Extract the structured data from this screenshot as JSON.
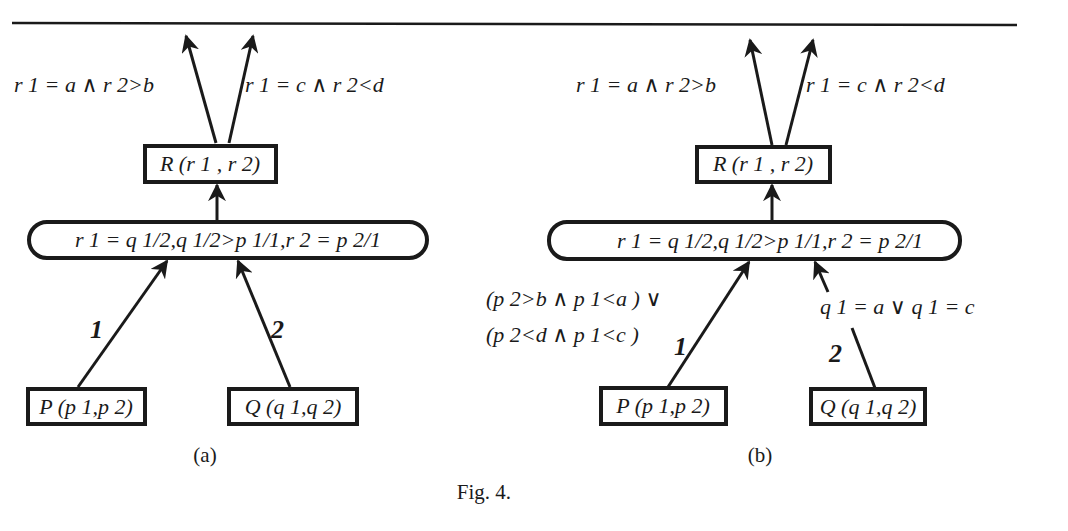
{
  "figure": {
    "caption": "Fig. 4.",
    "panels": [
      {
        "id": "a",
        "label": "(a)",
        "top_edge_labels": {
          "left": "r 1 = a ∧ r 2>b",
          "right": "r 1 = c ∧ r 2<d"
        },
        "result_node": "R (r 1 , r 2)",
        "join_node": "r 1 = q 1/2,q 1/2>p 1/1,r 2 = p 2/1",
        "input_nodes": [
          {
            "name": "P (p 1,p 2)",
            "edge_number": "1"
          },
          {
            "name": "Q (q 1,q 2)",
            "edge_number": "2"
          }
        ]
      },
      {
        "id": "b",
        "label": "(b)",
        "top_edge_labels": {
          "left": "r 1 = a ∧ r 2>b",
          "right": "r 1 = c ∧ r 2<d"
        },
        "result_node": "R (r 1 , r 2)",
        "join_node": "r 1 = q 1/2,q 1/2>p 1/1,r 2 = p 2/1",
        "input_nodes": [
          {
            "name": "P (p 1,p 2)",
            "edge_number": "1",
            "edge_condition": [
              "(p 2>b ∧ p 1<a ) ∨",
              "(p 2<d ∧ p 1<c )"
            ]
          },
          {
            "name": "Q (q 1,q 2)",
            "edge_number": "2",
            "edge_condition": [
              "q 1 = a ∨ q 1 = c"
            ]
          }
        ]
      }
    ]
  }
}
